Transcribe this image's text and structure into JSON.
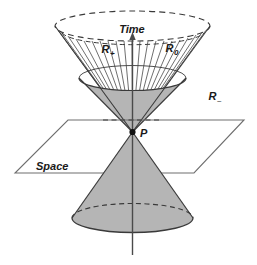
{
  "figure": {
    "name": "light-cone-spacetime-diagram",
    "colors": {
      "cone_fill": "#b5b5b5",
      "stroke": "#3a3a3a",
      "plane_stroke": "#6e6e6e",
      "axis": "#4a4a4a",
      "hatch": "#555555",
      "background": "#ffffff",
      "text": "#1a1a1a"
    },
    "labels": {
      "time_axis": "Time",
      "space_plane": "Space",
      "future_region": "R",
      "future_region_sub": "+",
      "null_region": "R",
      "null_region_sub": "0",
      "past_region": "R",
      "past_region_sub": "–",
      "origin_point": "P"
    }
  }
}
